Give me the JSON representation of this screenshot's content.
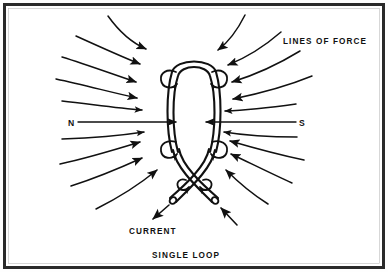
{
  "figure": {
    "kind": "physics-diagram",
    "caption": "SINGLE LOOP",
    "background_color": "#fefefe",
    "ink_color": "#111111",
    "frame": {
      "present": true,
      "color": "#2a2a2a",
      "inner_color": "#ffffff",
      "stroke_width": 3
    },
    "labels": {
      "lines_of_force": "LINES OF FORCE",
      "pole_north": "N",
      "pole_south": "S",
      "current": "CURRENT",
      "caption": "SINGLE LOOP"
    },
    "loop": {
      "description": "vertical oval conductor loop drawn as a double-line tube",
      "center_x": 194,
      "center_y": 112,
      "radius_x": 22,
      "radius_y": 54,
      "swirl_count": 4,
      "lead_ends": 2,
      "lead_crossing": "X-shape below loop"
    },
    "field_lines": {
      "total": 14,
      "arrow_style": "solid filled triangle",
      "direction": "inward toward the loop (N to S through the loop axis)",
      "axis_line": {
        "present": true,
        "y": 122,
        "from_x": 78,
        "to_x": 296,
        "arrowheads": 2
      }
    }
  }
}
